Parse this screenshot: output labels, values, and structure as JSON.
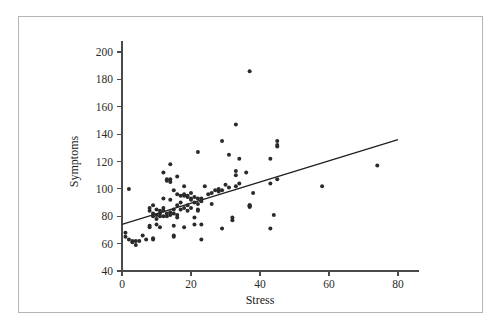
{
  "figure": {
    "frame_color": "#b4b4b4",
    "background": "#ffffff",
    "point_color": "#2a2a2a",
    "line_color": "#1f1f1f",
    "axis_color": "#4a4a4a"
  },
  "chart_data": {
    "type": "scatter",
    "title": "",
    "xlabel": "Stress",
    "ylabel": "Symptoms",
    "xlim": [
      0,
      86
    ],
    "ylim": [
      40,
      208
    ],
    "xticks": [
      0,
      20,
      40,
      60,
      80
    ],
    "yticks": [
      40,
      60,
      80,
      100,
      120,
      140,
      160,
      180,
      200
    ],
    "xtick_labels": [
      "0",
      "20",
      "40",
      "60",
      "80"
    ],
    "ytick_labels": [
      "40",
      "60",
      "80",
      "100",
      "120",
      "140",
      "160",
      "180",
      "200"
    ],
    "grid": false,
    "legend": null,
    "series": [
      {
        "name": "observations",
        "marker": "circle",
        "points": [
          [
            1,
            68
          ],
          [
            1,
            65
          ],
          [
            2,
            63
          ],
          [
            2,
            100
          ],
          [
            3,
            62
          ],
          [
            3,
            61
          ],
          [
            4,
            62
          ],
          [
            4,
            59
          ],
          [
            5,
            62
          ],
          [
            6,
            66
          ],
          [
            7,
            63
          ],
          [
            8,
            86
          ],
          [
            8,
            84
          ],
          [
            8,
            73
          ],
          [
            8,
            72
          ],
          [
            9,
            88
          ],
          [
            9,
            82
          ],
          [
            9,
            80
          ],
          [
            9,
            64
          ],
          [
            9,
            63
          ],
          [
            10,
            85
          ],
          [
            10,
            81
          ],
          [
            10,
            78
          ],
          [
            10,
            74
          ],
          [
            11,
            84
          ],
          [
            11,
            82
          ],
          [
            11,
            80
          ],
          [
            11,
            72
          ],
          [
            12,
            112
          ],
          [
            12,
            93
          ],
          [
            12,
            86
          ],
          [
            12,
            84
          ],
          [
            12,
            80
          ],
          [
            13,
            107
          ],
          [
            13,
            106
          ],
          [
            13,
            82
          ],
          [
            13,
            80
          ],
          [
            14,
            118
          ],
          [
            14,
            107
          ],
          [
            14,
            105
          ],
          [
            14,
            92
          ],
          [
            14,
            83
          ],
          [
            14,
            81
          ],
          [
            15,
            99
          ],
          [
            15,
            85
          ],
          [
            15,
            82
          ],
          [
            15,
            73
          ],
          [
            15,
            66
          ],
          [
            15,
            65
          ],
          [
            16,
            109
          ],
          [
            16,
            96
          ],
          [
            16,
            88
          ],
          [
            16,
            81
          ],
          [
            16,
            79
          ],
          [
            17,
            95
          ],
          [
            17,
            90
          ],
          [
            17,
            85
          ],
          [
            18,
            102
          ],
          [
            18,
            96
          ],
          [
            18,
            95
          ],
          [
            18,
            86
          ],
          [
            18,
            72
          ],
          [
            19,
            95
          ],
          [
            19,
            94
          ],
          [
            19,
            88
          ],
          [
            19,
            84
          ],
          [
            20,
            97
          ],
          [
            20,
            93
          ],
          [
            20,
            92
          ],
          [
            20,
            86
          ],
          [
            21,
            94
          ],
          [
            21,
            90
          ],
          [
            21,
            79
          ],
          [
            21,
            74
          ],
          [
            22,
            127
          ],
          [
            22,
            93
          ],
          [
            22,
            89
          ],
          [
            22,
            85
          ],
          [
            22,
            84
          ],
          [
            23,
            93
          ],
          [
            23,
            91
          ],
          [
            23,
            74
          ],
          [
            23,
            63
          ],
          [
            24,
            102
          ],
          [
            25,
            96
          ],
          [
            26,
            97
          ],
          [
            26,
            89
          ],
          [
            27,
            99
          ],
          [
            28,
            100
          ],
          [
            28,
            98
          ],
          [
            29,
            135
          ],
          [
            29,
            99
          ],
          [
            29,
            71
          ],
          [
            30,
            103
          ],
          [
            31,
            125
          ],
          [
            31,
            101
          ],
          [
            32,
            79
          ],
          [
            32,
            77
          ],
          [
            33,
            147
          ],
          [
            33,
            113
          ],
          [
            33,
            110
          ],
          [
            33,
            102
          ],
          [
            34,
            122
          ],
          [
            34,
            104
          ],
          [
            36,
            112
          ],
          [
            37,
            186
          ],
          [
            37,
            88
          ],
          [
            37,
            88
          ],
          [
            37,
            87
          ],
          [
            37,
            87
          ],
          [
            38,
            97
          ],
          [
            43,
            122
          ],
          [
            43,
            104
          ],
          [
            43,
            71
          ],
          [
            44,
            81
          ],
          [
            45,
            135
          ],
          [
            45,
            132
          ],
          [
            45,
            131
          ],
          [
            45,
            107
          ],
          [
            58,
            102
          ],
          [
            74,
            117
          ]
        ]
      }
    ],
    "fit_line": {
      "type": "linear-regression",
      "x_start": 0,
      "y_start": 74,
      "x_end": 80,
      "y_end": 136,
      "slope": 0.775,
      "intercept": 74
    }
  }
}
